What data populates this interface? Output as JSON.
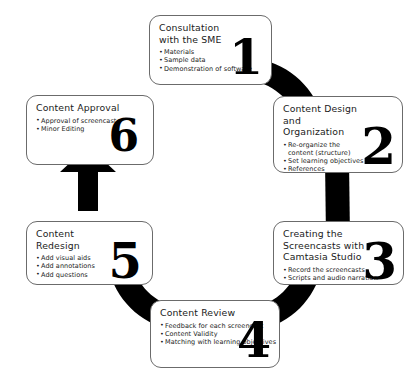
{
  "diagram": {
    "type": "circular-process",
    "ring_color": "#000000",
    "box_border_color": "#6b6b6b",
    "box_fill_color": "#ffffff",
    "text_color": "#1b1b1b",
    "steps": [
      {
        "number": "1",
        "title": "Consultation with the SME",
        "bullets": [
          "Materials",
          "Sample data",
          "Demonstration of software"
        ]
      },
      {
        "number": "2",
        "title": "Content Design and Organization",
        "bullets": [
          "Re-organize the content (structure)",
          "Set learning objectives",
          "References"
        ]
      },
      {
        "number": "3",
        "title": "Creating the Screencasts with Camtasia Studio",
        "bullets": [
          "Record the screencasts",
          "Scripts and audio narration"
        ]
      },
      {
        "number": "4",
        "title": "Content Review",
        "bullets": [
          "Feedback for each screencast",
          "Content Validity",
          "Matching with learning objectives"
        ]
      },
      {
        "number": "5",
        "title": "Content Redesign",
        "bullets": [
          "Add visual aids",
          "Add annotations",
          "Add questions"
        ]
      },
      {
        "number": "6",
        "title": "Content Approval",
        "bullets": [
          "Approval of screencast",
          "Minor Editing"
        ]
      }
    ]
  }
}
